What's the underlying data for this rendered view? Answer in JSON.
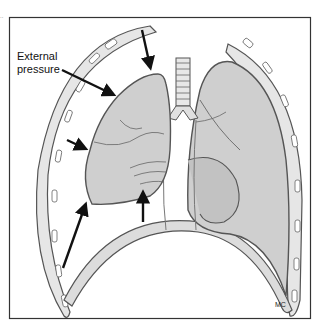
{
  "figure": {
    "labels": {
      "external_pressure_line1": "External",
      "external_pressure_line2": "pressure"
    },
    "credit": "MC",
    "corner_mark": "..",
    "colors": {
      "frame": "#333333",
      "lung_fill": "#cfcfcf",
      "lung_stroke": "#555555",
      "arrow": "#111111",
      "rib_fill": "#e8e8e8",
      "background": "#ffffff"
    },
    "arrows": [
      {
        "name": "arrow-top",
        "direction": "down"
      },
      {
        "name": "arrow-external-pressure",
        "direction": "down-right"
      },
      {
        "name": "arrow-side",
        "direction": "right"
      },
      {
        "name": "arrow-bottom-left",
        "direction": "up-right"
      },
      {
        "name": "arrow-bottom",
        "direction": "up"
      }
    ]
  }
}
